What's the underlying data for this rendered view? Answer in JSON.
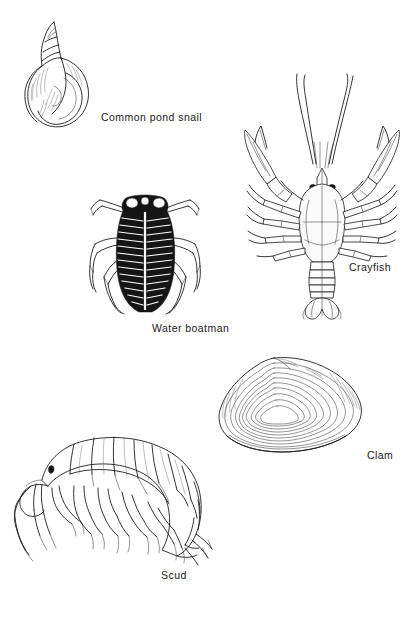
{
  "page": {
    "background_color": "#ffffff",
    "ink_color": "#1d1d1d",
    "width": 416,
    "height": 619,
    "style": "black and white line-art scientific illustration plate"
  },
  "figures": [
    {
      "id": "snail",
      "label": "Common pond snail",
      "icon": "pond-snail-illustration",
      "description": "Right-handed spiral gastropod shell with pointed apex upper left, large rounded body whorl and oval aperture",
      "position": {
        "x": 14,
        "y": 18,
        "width": 88,
        "height": 118
      },
      "label_position": {
        "x": 101,
        "y": 112
      }
    },
    {
      "id": "crayfish",
      "label": "Crayfish",
      "icon": "crayfish-illustration",
      "description": "Dorsal view of crayfish with two long antennae, paired chelipeds (claws), four pairs of walking legs, segmented abdomen and fan-shaped tail",
      "position": {
        "x": 243,
        "y": 72,
        "width": 155,
        "height": 228
      },
      "label_position": {
        "x": 349,
        "y": 262
      }
    },
    {
      "id": "boatman",
      "label": "Water boatman",
      "icon": "water-boatman-illustration",
      "description": "Dorsal view of water boatman, dark oval striated body, pale eyes on dark head, three pairs of legs with long oar-like hind legs",
      "position": {
        "x": 82,
        "y": 188,
        "width": 126,
        "height": 126
      },
      "label_position": {
        "x": 152,
        "y": 323
      }
    },
    {
      "id": "clam",
      "label": "Clam",
      "icon": "clam-illustration",
      "description": "Single bivalve shell valve in side view with concentric growth rings radiating from the umbo",
      "position": {
        "x": 216,
        "y": 352,
        "width": 146,
        "height": 112
      },
      "label_position": {
        "x": 367,
        "y": 450
      }
    },
    {
      "id": "scud",
      "label": "Scud",
      "icon": "scud-illustration",
      "description": "Lateral view of an amphipod (scud) with arched segmented body, head with antennae at left, numerous legs beneath and uropods at the rear",
      "position": {
        "x": 12,
        "y": 428,
        "width": 206,
        "height": 136
      },
      "label_position": {
        "x": 161,
        "y": 570
      }
    }
  ]
}
